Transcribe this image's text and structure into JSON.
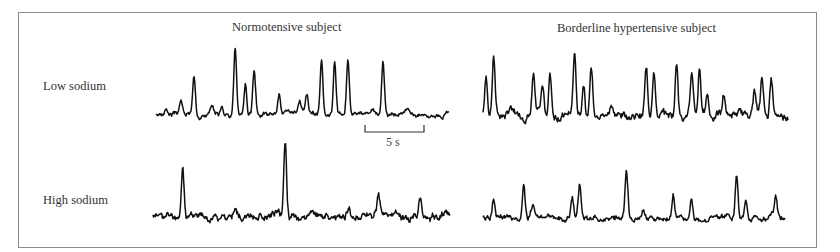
{
  "chart_data": {
    "type": "line",
    "title": "",
    "column_titles": [
      "Normotensive subject",
      "Borderline hypertensive subject"
    ],
    "row_labels": [
      "Low sodium",
      "High sodium"
    ],
    "scale_bar": {
      "label": "5 s",
      "seconds": 5
    },
    "grid": false,
    "axes": false,
    "series": [
      {
        "name": "Normotensive - Low sodium",
        "noise": 0.04,
        "seed": 3,
        "peaks": [
          [
            0.035,
            0.08
          ],
          [
            0.085,
            0.2
          ],
          [
            0.13,
            0.55
          ],
          [
            0.19,
            0.08
          ],
          [
            0.225,
            0.1
          ],
          [
            0.27,
            0.95
          ],
          [
            0.305,
            0.46
          ],
          [
            0.335,
            0.64
          ],
          [
            0.42,
            0.3
          ],
          [
            0.49,
            0.16
          ],
          [
            0.515,
            0.27
          ],
          [
            0.565,
            0.8
          ],
          [
            0.61,
            0.82
          ],
          [
            0.655,
            0.83
          ],
          [
            0.74,
            0.08
          ],
          [
            0.775,
            0.82
          ],
          [
            0.86,
            0.06
          ]
        ]
      },
      {
        "name": "Borderline hypertensive - Low sodium",
        "noise": 0.07,
        "seed": 7,
        "peaks": [
          [
            0.01,
            0.55
          ],
          [
            0.035,
            0.9
          ],
          [
            0.09,
            0.12
          ],
          [
            0.165,
            0.6
          ],
          [
            0.195,
            0.4
          ],
          [
            0.22,
            0.6
          ],
          [
            0.3,
            0.9
          ],
          [
            0.33,
            0.5
          ],
          [
            0.355,
            0.72
          ],
          [
            0.42,
            0.18
          ],
          [
            0.535,
            0.68
          ],
          [
            0.56,
            0.72
          ],
          [
            0.635,
            0.8
          ],
          [
            0.685,
            0.6
          ],
          [
            0.71,
            0.7
          ],
          [
            0.735,
            0.36
          ],
          [
            0.79,
            0.3
          ],
          [
            0.89,
            0.38
          ],
          [
            0.915,
            0.55
          ],
          [
            0.945,
            0.54
          ]
        ]
      },
      {
        "name": "Normotensive - High sodium",
        "noise": 0.06,
        "seed": 11,
        "peaks": [
          [
            0.1,
            0.65
          ],
          [
            0.28,
            0.1
          ],
          [
            0.445,
            1.0
          ],
          [
            0.66,
            0.15
          ],
          [
            0.76,
            0.32
          ],
          [
            0.9,
            0.26
          ]
        ]
      },
      {
        "name": "Borderline hypertensive - High sodium",
        "noise": 0.06,
        "seed": 19,
        "peaks": [
          [
            0.035,
            0.35
          ],
          [
            0.135,
            0.55
          ],
          [
            0.165,
            0.22
          ],
          [
            0.295,
            0.32
          ],
          [
            0.32,
            0.6
          ],
          [
            0.475,
            0.78
          ],
          [
            0.53,
            0.12
          ],
          [
            0.63,
            0.44
          ],
          [
            0.69,
            0.36
          ],
          [
            0.84,
            0.8
          ],
          [
            0.87,
            0.26
          ],
          [
            0.97,
            0.4
          ]
        ]
      }
    ]
  },
  "labels": {
    "col1": "Normotensive subject",
    "col2": "Borderline hypertensive subject",
    "row1": "Low sodium",
    "row2": "High sodium",
    "scale": "5 s"
  },
  "colors": {
    "trace": "#111111",
    "frame": "#8a8a8a",
    "text": "#333333"
  }
}
